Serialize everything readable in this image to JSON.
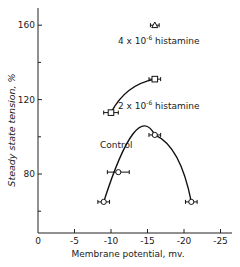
{
  "chart_data": {
    "type": "scatter",
    "title": "",
    "xlabel": "Membrane potential, mv.",
    "ylabel": "Steady state tension, %",
    "xlim": [
      0,
      -27
    ],
    "ylim": [
      48,
      170
    ],
    "x_ticks": [
      "0",
      "-5",
      "-10",
      "-15",
      "-20",
      "-25"
    ],
    "x_tick_values": [
      0,
      -5,
      -10,
      -15,
      -20,
      -25
    ],
    "y_ticks": [
      "80",
      "120",
      "160"
    ],
    "y_tick_values": [
      80,
      120,
      160
    ],
    "y_minor_ticks": [
      60,
      100,
      140
    ],
    "grid": false,
    "series": [
      {
        "name": "Control",
        "marker": "circle",
        "points": [
          {
            "x": -9,
            "y": 65
          },
          {
            "x": -11,
            "y": 81
          },
          {
            "x": -16,
            "y": 101
          },
          {
            "x": -21,
            "y": 65
          }
        ],
        "xerr": [
          0.8,
          1.5,
          0.8,
          0.8
        ]
      },
      {
        "name": "2 x 10^-6 histamine",
        "marker": "square",
        "points": [
          {
            "x": -10,
            "y": 113
          },
          {
            "x": -16,
            "y": 131
          }
        ],
        "xerr": [
          1.0,
          0.8
        ]
      },
      {
        "name": "4 x 10^-6 histamine",
        "marker": "triangle",
        "points": [
          {
            "x": -16,
            "y": 160
          }
        ],
        "xerr": [
          0.6
        ]
      }
    ],
    "annotations": [
      {
        "text": "Control",
        "near_series": "Control"
      },
      {
        "text": "2 x 10-6 histamine",
        "near_series": "2 x 10^-6 histamine"
      },
      {
        "text": "4 x 10-6 histamine",
        "near_series": "4 x 10^-6 histamine"
      }
    ]
  },
  "labels": {
    "xlabel": "Membrane potential, mv.",
    "ylabel": "Steady state tension, %",
    "control": "Control",
    "h2_coef": "2 x 10",
    "h2_exp": "-6",
    "h2_name": " histamine",
    "h4_coef": "4 x 10",
    "h4_exp": "-6",
    "h4_name": " histamine"
  }
}
